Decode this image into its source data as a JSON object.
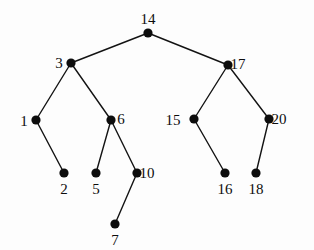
{
  "figure": {
    "kind": "binary-search-tree-diagram",
    "background_color": "#fdfdfd",
    "node_color": "#0d0d0d",
    "edge_color": "#131313",
    "label_color": "#0d0d0d",
    "node_radius": 4.6,
    "edge_width": 1.4,
    "width": 314,
    "height": 250
  },
  "nodes": [
    {
      "id": "n14",
      "label": "14",
      "x": 148,
      "y": 33,
      "label_x": 148,
      "label_y": 19,
      "label_anchor": "above"
    },
    {
      "id": "n3",
      "label": "3",
      "x": 71,
      "y": 63,
      "label_x": 59,
      "label_y": 63,
      "label_anchor": "left"
    },
    {
      "id": "n17",
      "label": "17",
      "x": 228,
      "y": 65,
      "label_x": 238,
      "label_y": 64,
      "label_anchor": "right"
    },
    {
      "id": "n1",
      "label": "1",
      "x": 36,
      "y": 120,
      "label_x": 24,
      "label_y": 121,
      "label_anchor": "left"
    },
    {
      "id": "n6",
      "label": "6",
      "x": 111,
      "y": 120,
      "label_x": 121,
      "label_y": 119,
      "label_anchor": "right"
    },
    {
      "id": "n15",
      "label": "15",
      "x": 194,
      "y": 119,
      "label_x": 173,
      "label_y": 120,
      "label_anchor": "left"
    },
    {
      "id": "n20",
      "label": "20",
      "x": 269,
      "y": 119,
      "label_x": 279,
      "label_y": 119,
      "label_anchor": "right"
    },
    {
      "id": "n2",
      "label": "2",
      "x": 64,
      "y": 173,
      "label_x": 64,
      "label_y": 189,
      "label_anchor": "below"
    },
    {
      "id": "n5",
      "label": "5",
      "x": 96,
      "y": 173,
      "label_x": 96,
      "label_y": 189,
      "label_anchor": "below"
    },
    {
      "id": "n10",
      "label": "10",
      "x": 137,
      "y": 173,
      "label_x": 147,
      "label_y": 173,
      "label_anchor": "right"
    },
    {
      "id": "n16",
      "label": "16",
      "x": 225,
      "y": 173,
      "label_x": 225,
      "label_y": 189,
      "label_anchor": "below"
    },
    {
      "id": "n18",
      "label": "18",
      "x": 256,
      "y": 173,
      "label_x": 256,
      "label_y": 189,
      "label_anchor": "below"
    },
    {
      "id": "n7",
      "label": "7",
      "x": 115,
      "y": 224,
      "label_x": 115,
      "label_y": 240,
      "label_anchor": "below"
    }
  ],
  "edges": [
    {
      "from": "n14",
      "to": "n3",
      "x1": 148,
      "y1": 33,
      "x2": 71,
      "y2": 63
    },
    {
      "from": "n14",
      "to": "n17",
      "x1": 148,
      "y1": 33,
      "x2": 228,
      "y2": 65
    },
    {
      "from": "n3",
      "to": "n1",
      "x1": 71,
      "y1": 63,
      "x2": 36,
      "y2": 120
    },
    {
      "from": "n3",
      "to": "n6",
      "x1": 71,
      "y1": 63,
      "x2": 111,
      "y2": 120
    },
    {
      "from": "n17",
      "to": "n15",
      "x1": 228,
      "y1": 65,
      "x2": 194,
      "y2": 119
    },
    {
      "from": "n17",
      "to": "n20",
      "x1": 228,
      "y1": 65,
      "x2": 269,
      "y2": 119
    },
    {
      "from": "n1",
      "to": "n2",
      "x1": 36,
      "y1": 120,
      "x2": 64,
      "y2": 173
    },
    {
      "from": "n6",
      "to": "n5",
      "x1": 111,
      "y1": 120,
      "x2": 96,
      "y2": 173
    },
    {
      "from": "n6",
      "to": "n10",
      "x1": 111,
      "y1": 120,
      "x2": 137,
      "y2": 173
    },
    {
      "from": "n15",
      "to": "n16",
      "x1": 194,
      "y1": 119,
      "x2": 225,
      "y2": 173
    },
    {
      "from": "n20",
      "to": "n18",
      "x1": 269,
      "y1": 119,
      "x2": 256,
      "y2": 173
    },
    {
      "from": "n10",
      "to": "n7",
      "x1": 137,
      "y1": 173,
      "x2": 115,
      "y2": 224
    }
  ]
}
